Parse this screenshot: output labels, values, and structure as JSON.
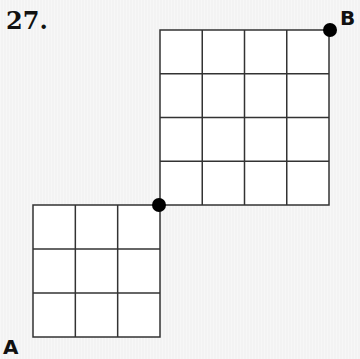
{
  "problem": {
    "number": "27."
  },
  "points": {
    "A": {
      "label": "A"
    },
    "B": {
      "label": "B"
    }
  },
  "grids": [
    {
      "name": "small-grid",
      "rows": 3,
      "cols": 3,
      "x": 33,
      "y": 205,
      "width": 127,
      "height": 132
    },
    {
      "name": "large-grid",
      "rows": 4,
      "cols": 4,
      "x": 160,
      "y": 30,
      "width": 169,
      "height": 175
    }
  ],
  "dots": [
    {
      "name": "junction-dot",
      "cx": 159,
      "cy": 205,
      "r": 7
    },
    {
      "name": "point-b-dot",
      "cx": 330,
      "cy": 30,
      "r": 7
    }
  ],
  "colors": {
    "line": "#333333",
    "dot": "#000000",
    "fill": "#ffffff"
  }
}
